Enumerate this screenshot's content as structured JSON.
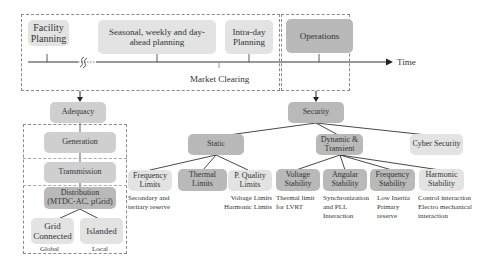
{
  "timeline": {
    "axis_label": "Time",
    "market_clearing_label": "Market Clearing",
    "boxes": {
      "facility_planning": "Facility Planning",
      "seasonal_planning": "Seasonal, weekly and day-ahead planning",
      "intra_day_planning": "Intra-day Planning",
      "operations": "Operations"
    },
    "break_symbol": "§"
  },
  "adequacy_branch": {
    "root": "Adequacy",
    "levels": [
      "Generation",
      "Transmission",
      "Distribution (MTDC-AC, µGrid)"
    ],
    "modes": [
      {
        "label": "Grid Connected",
        "scope": "Global"
      },
      {
        "label": "Islanded",
        "scope": "Local"
      }
    ]
  },
  "security_branch": {
    "root": "Security",
    "categories": {
      "static": "Static",
      "dynamic": "Dynamic & Transient",
      "cyber": "Cyber Security"
    },
    "static_children": [
      {
        "label": "Frequency Limits",
        "note": "Secondary and tertiary reserve"
      },
      {
        "label": "Thermal Limits",
        "note": ""
      },
      {
        "label": "P. Quality Limits",
        "note": "Voltage Limits Harmonic Limits"
      }
    ],
    "dynamic_children": [
      {
        "label": "Voltage Stability",
        "note": "Thermal limit for LVRT"
      },
      {
        "label": "Angular Stability",
        "note": "Synchronization and PLL Interaction"
      },
      {
        "label": "Frequency Stability",
        "note": "Low Inertia Primary reserve"
      },
      {
        "label": "Harmonic Stability",
        "note": "Control interaction Electro mechanical interaction"
      }
    ]
  },
  "notes_lines": {
    "freq_limits": [
      "Secondary and",
      "tertiary reserve"
    ],
    "pq_limits": [
      "Voltage Limits",
      "Harmonic Limits"
    ],
    "voltage_stab": [
      "Thermal limit",
      "for LVRT"
    ],
    "angular_stab": [
      "Synchronization",
      "and PLL",
      "Interaction"
    ],
    "freq_stab": [
      "Low Inertia",
      "Primary",
      "reserve"
    ],
    "harmonic_stab": [
      "Control interaction",
      "Electro mechanical",
      "interaction"
    ]
  },
  "colors": {
    "light_box": "#e3e3e3",
    "mid_box": "#cfcfcf",
    "dark_box": "#b9b9b9",
    "line": "#333333",
    "dashed_border": "#8a8a8a"
  }
}
